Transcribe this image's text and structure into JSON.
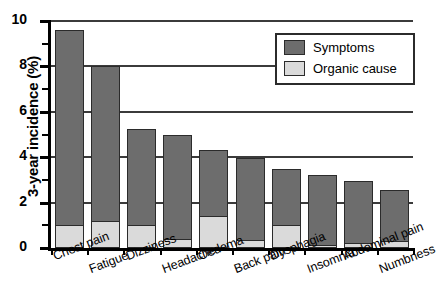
{
  "chart_data": {
    "type": "bar",
    "stacked": true,
    "title": "",
    "subtitle": "",
    "xlabel": "",
    "ylabel": "3-year incidence (%)",
    "ylim": [
      0,
      10
    ],
    "ytick_labels": [
      "0",
      "2",
      "4",
      "6",
      "8",
      "10"
    ],
    "ytick_values": [
      0,
      2,
      4,
      6,
      8,
      10
    ],
    "grid": "horizontal",
    "legend_position": "top-right",
    "categories": [
      "Chest pain",
      "Fatigue",
      "Dizziness",
      "Headache",
      "Oedema",
      "Back pain",
      "Dysphagia",
      "Insomnia",
      "Abdominal pain",
      "Numbness"
    ],
    "series": [
      {
        "name": "Symptoms",
        "color": "#6d6d6d",
        "values": [
          9.6,
          8.0,
          5.25,
          5.0,
          4.3,
          3.95,
          3.5,
          3.2,
          2.95,
          2.55
        ]
      },
      {
        "name": "Organic cause",
        "color": "#dadada",
        "values": [
          1.0,
          1.2,
          1.0,
          0.4,
          1.4,
          0.35,
          1.0,
          0.15,
          0.2,
          0.3
        ]
      }
    ]
  },
  "legend": {
    "entries": [
      {
        "label": "Symptoms",
        "color": "#6d6d6d"
      },
      {
        "label": "Organic cause",
        "color": "#dadada"
      }
    ]
  },
  "colors": {
    "symptoms": "#6d6d6d",
    "organic_cause": "#dadada",
    "axis": "#000000",
    "gridline": "#3b3b3b",
    "bar_outline": "#2b2b2b",
    "background": "#ffffff"
  }
}
